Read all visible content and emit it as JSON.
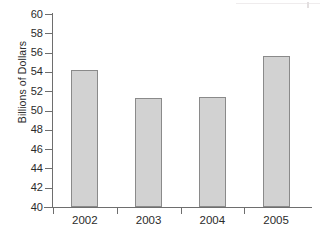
{
  "chart_data": {
    "type": "bar",
    "title": "",
    "xlabel": "",
    "ylabel": "Billions of Dollars",
    "categories": [
      "2002",
      "2003",
      "2004",
      "2005"
    ],
    "values": [
      54.2,
      51.3,
      51.4,
      55.7
    ],
    "ylim": [
      40,
      60
    ],
    "ytick_step": 2,
    "yticks": [
      40,
      42,
      44,
      46,
      48,
      50,
      52,
      54,
      56,
      58,
      60
    ],
    "ytick_labels": [
      "40",
      "42",
      "44",
      "46",
      "48",
      "50",
      "52",
      "54",
      "56",
      "58",
      "60"
    ],
    "grid": false,
    "legend": null,
    "bar_fill_color": "#d2d2d2",
    "bar_border_color": "#8a8a8a",
    "axis_color": "#6e6e6e",
    "background_color": "#ffffff"
  }
}
